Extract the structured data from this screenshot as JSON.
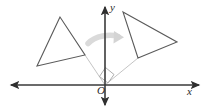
{
  "figure": {
    "width": 208,
    "height": 112,
    "background_color": "#ffffff"
  },
  "axes": {
    "origin": {
      "x": 105,
      "y": 85,
      "label": "O"
    },
    "x_axis": {
      "label": "x",
      "color": "#3a3a3a",
      "start": {
        "x": 9,
        "y": 85
      },
      "end": {
        "x": 201,
        "y": 85
      },
      "arrows": "both"
    },
    "y_axis": {
      "label": "y",
      "color": "#3a3a3a",
      "start": {
        "x": 105,
        "y": 107
      },
      "end": {
        "x": 105,
        "y": 5
      },
      "arrows": "both"
    }
  },
  "shapes": {
    "preimage_triangle": {
      "name": "left-triangle",
      "stroke_color": "#5a5a5a",
      "fill": "none",
      "vertices": [
        {
          "x": 60,
          "y": 17
        },
        {
          "x": 37,
          "y": 66
        },
        {
          "x": 85,
          "y": 55
        }
      ]
    },
    "image_triangle": {
      "name": "right-triangle",
      "stroke_color": "#5a5a5a",
      "fill": "none",
      "vertices": [
        {
          "x": 123,
          "y": 12
        },
        {
          "x": 177,
          "y": 42
        },
        {
          "x": 138,
          "y": 58
        }
      ]
    }
  },
  "construction": {
    "ray_to_preimage": {
      "name": "origin-to-preimage-vertex",
      "color": "#b9b9b9",
      "from": {
        "x": 105,
        "y": 85
      },
      "to": {
        "x": 85,
        "y": 55
      }
    },
    "ray_to_image": {
      "name": "origin-to-image-vertex",
      "color": "#b9b9b9",
      "from": {
        "x": 105,
        "y": 85
      },
      "to": {
        "x": 138,
        "y": 58
      }
    },
    "right_angle_marker": {
      "name": "right-angle-square",
      "color": "#9a9a9a",
      "points": "99,77 105,68 114,75 108,83"
    }
  },
  "rotation_arrow": {
    "name": "curved-rotation-arrow",
    "color": "#d6d6d6",
    "direction": "clockwise-right",
    "start": {
      "x": 88,
      "y": 41
    },
    "end": {
      "x": 122,
      "y": 38
    }
  }
}
